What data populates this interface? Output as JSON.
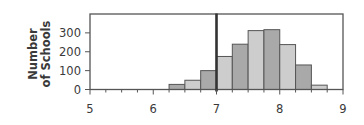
{
  "chart_data": {
    "type": "bar",
    "title": "",
    "xlabel": "",
    "ylabel": "Number of Schools",
    "ylabel_lines": [
      "Number",
      "of Schools"
    ],
    "xlim": [
      5,
      9
    ],
    "ylim": [
      0,
      400
    ],
    "x_ticks": [
      5,
      6,
      7,
      8,
      9
    ],
    "x_tick_labels": [
      "5",
      "6",
      "7",
      "8",
      "9"
    ],
    "x_minor_step": 0.25,
    "y_ticks": [
      0,
      100,
      200,
      300
    ],
    "y_tick_labels": [
      "0",
      "100",
      "200",
      "300"
    ],
    "bin_width": 0.25,
    "bins": [
      {
        "start": 6.25,
        "end": 6.5,
        "value": 27
      },
      {
        "start": 6.5,
        "end": 6.75,
        "value": 49
      },
      {
        "start": 6.75,
        "end": 7.0,
        "value": 100
      },
      {
        "start": 7.0,
        "end": 7.25,
        "value": 175
      },
      {
        "start": 7.25,
        "end": 7.5,
        "value": 240
      },
      {
        "start": 7.5,
        "end": 7.75,
        "value": 312
      },
      {
        "start": 7.75,
        "end": 8.0,
        "value": 317
      },
      {
        "start": 8.0,
        "end": 8.25,
        "value": 238
      },
      {
        "start": 8.25,
        "end": 8.5,
        "value": 130
      },
      {
        "start": 8.5,
        "end": 8.75,
        "value": 23
      }
    ],
    "categories": [
      "6.25-6.5",
      "6.5-6.75",
      "6.75-7.0",
      "7.0-7.25",
      "7.25-7.5",
      "7.5-7.75",
      "7.75-8.0",
      "8.0-8.25",
      "8.25-8.5",
      "8.5-8.75"
    ],
    "values": [
      27,
      49,
      100,
      175,
      240,
      312,
      317,
      238,
      130,
      23
    ],
    "reference_line": {
      "x": 7.0,
      "orientation": "vertical"
    },
    "grid": false,
    "legend": null,
    "colors": {
      "bar_dark": "#a9a9a9",
      "bar_light": "#cdcdcd",
      "bar_outline": "#555555",
      "axis": "#555555",
      "reference_line": "#333333",
      "text": "#3a3a3a"
    }
  }
}
